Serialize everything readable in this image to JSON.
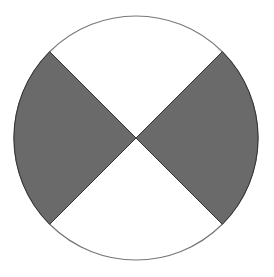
{
  "diagram": {
    "type": "circle-with-shaded-sectors",
    "circle": {
      "cx": 136,
      "cy": 138,
      "r": 122,
      "stroke": "#777777",
      "fill": "#ffffff"
    },
    "shaded_fill": "#6a6a6a",
    "sectors": [
      {
        "name": "left-sector",
        "shaded": true,
        "from_deg": 135,
        "to_deg": 225
      },
      {
        "name": "right-sector",
        "shaded": true,
        "from_deg": -45,
        "to_deg": 45
      },
      {
        "name": "top-sector",
        "shaded": false,
        "from_deg": 45,
        "to_deg": 135
      },
      {
        "name": "bottom-sector",
        "shaded": false,
        "from_deg": 225,
        "to_deg": 315
      }
    ]
  }
}
